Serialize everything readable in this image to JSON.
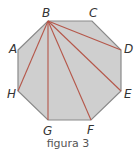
{
  "figure": {
    "caption": "figura 3",
    "colors": {
      "fill": "#cfcfcf",
      "stroke": "#8a8a8a",
      "diagonal": "#b5574a",
      "label": "#333333"
    },
    "vertices": [
      {
        "name": "A",
        "x": 18,
        "y": 50,
        "lx": 9,
        "ly": 53
      },
      {
        "name": "B",
        "x": 48,
        "y": 21,
        "lx": 42,
        "ly": 17
      },
      {
        "name": "C",
        "x": 92,
        "y": 21,
        "lx": 89,
        "ly": 17
      },
      {
        "name": "D",
        "x": 121,
        "y": 50,
        "lx": 124,
        "ly": 53
      },
      {
        "name": "E",
        "x": 121,
        "y": 91,
        "lx": 124,
        "ly": 98
      },
      {
        "name": "F",
        "x": 91,
        "y": 120,
        "lx": 87,
        "ly": 134
      },
      {
        "name": "G",
        "x": 48,
        "y": 120,
        "lx": 43,
        "ly": 135
      },
      {
        "name": "H",
        "x": 18,
        "y": 91,
        "lx": 7,
        "ly": 98
      }
    ],
    "diagonals_from": "B",
    "diagonals_to": [
      "D",
      "E",
      "F",
      "G",
      "H"
    ]
  }
}
